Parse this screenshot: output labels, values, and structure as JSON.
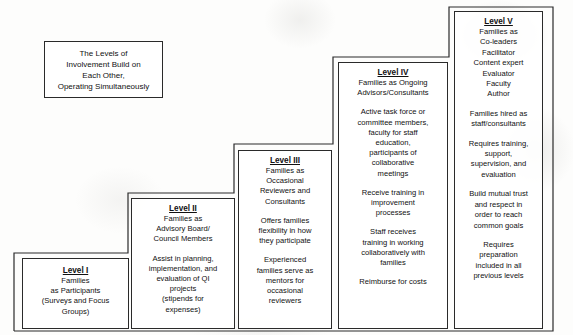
{
  "diagram": {
    "name": "levels-of-family-involvement-staircase",
    "caption_box": {
      "text": "The Levels of\nInvolvement Build on\nEach Other,\nOperating Simultaneously"
    },
    "line_color": "#2a2a2a",
    "background_color": "#fdfdfc",
    "levels": [
      {
        "id": "level-1",
        "title": "Level I",
        "subtitle": "Families\nas Participants\n(Surveys and Focus\nGroups)",
        "paragraphs": []
      },
      {
        "id": "level-2",
        "title": "Level II",
        "subtitle": "Families as\nAdvisory Board/\nCouncil Members",
        "paragraphs": [
          "Assist in planning,\nimplementation, and\nevaluation of QI\nprojects\n(stipends for\nexpenses)"
        ]
      },
      {
        "id": "level-3",
        "title": "Level III",
        "subtitle": "Families as\nOccasional\nReviewers and\nConsultants",
        "paragraphs": [
          "Offers families\nflexibility in how\nthey participate",
          "Experienced\nfamilies serve as\nmentors for\noccasional\nreviewers"
        ]
      },
      {
        "id": "level-4",
        "title": "Level IV",
        "subtitle": "Families as Ongoing\nAdvisors/Consultants",
        "paragraphs": [
          "Active task force or\ncommittee members,\nfaculty for staff\neducation,\nparticipants of\ncollaborative\nmeetings",
          "Receive training in\nimprovement\nprocesses",
          "Staff receives\ntraining in working\ncollaboratively with\nfamilies",
          "Reimburse for costs"
        ]
      },
      {
        "id": "level-5",
        "title": "Level V",
        "subtitle": "Families as\nCo-leaders\nFacilitator\nContent expert\nEvaluator\nFaculty\nAuthor",
        "paragraphs": [
          "Families hired as\nstaff/consultants",
          "Requires training,\nsupport,\nsupervision, and\nevaluation",
          "Build mutual trust\nand respect in\norder to reach\ncommon goals",
          "Requires\npreparation\nincluded in all\nprevious levels"
        ]
      }
    ]
  }
}
